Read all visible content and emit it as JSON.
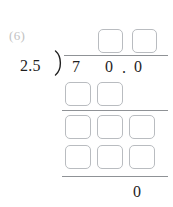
{
  "worksheet": {
    "problem_number": "(6)",
    "operation": "long-division",
    "divisor": "2.5",
    "dividend_digits": [
      "7",
      "0",
      ".",
      "0"
    ],
    "final_remainder": "0",
    "colors": {
      "box_border": "#b9bcc0",
      "rule": "#8f9296",
      "digit": "#1f1f1f",
      "problem_number": "#c2c2c2",
      "background": "#ffffff"
    },
    "quotient_row": {
      "label": "quotient",
      "boxes": [
        "",
        ""
      ]
    },
    "work_rows": [
      {
        "label": "first-partial-product",
        "boxes": [
          "",
          ""
        ]
      },
      {
        "label": "first-difference",
        "boxes": [
          "",
          "",
          ""
        ]
      },
      {
        "label": "second-partial-product",
        "boxes": [
          "",
          "",
          ""
        ]
      }
    ],
    "rules": [
      {
        "label": "vinculum"
      },
      {
        "label": "first-subtraction-rule"
      },
      {
        "label": "second-subtraction-rule"
      },
      {
        "label": "final-subtraction-rule"
      }
    ]
  }
}
